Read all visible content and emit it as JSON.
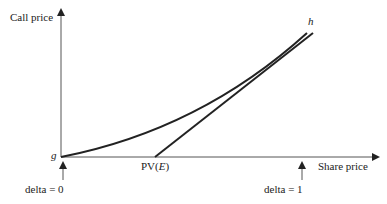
{
  "diagram": {
    "y_axis_label": "Call price",
    "x_axis_label": "Share price",
    "origin_label": "g",
    "curve_label": "h",
    "strike_label_prefix": "PV(",
    "strike_label_var": "E",
    "strike_label_suffix": ")",
    "left_marker_label": "delta = 0",
    "right_marker_label": "delta = 1"
  }
}
